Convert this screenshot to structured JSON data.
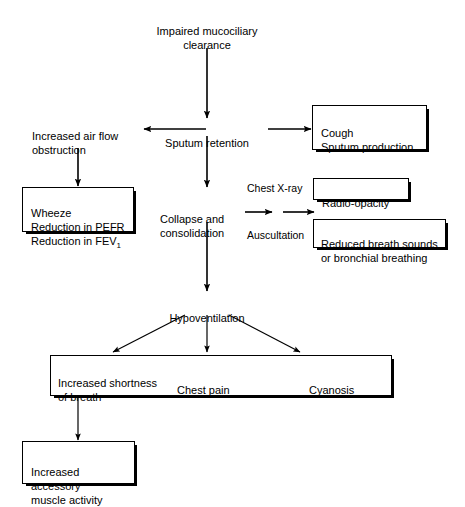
{
  "diagram": {
    "background": "#ffffff",
    "line_color": "#000000",
    "nodes": {
      "impaired": {
        "text": "Impaired mucociliary\nclearance",
        "boxed": false
      },
      "sputum_retention": {
        "text": "Sputum retention",
        "boxed": false
      },
      "airflow_obstruction": {
        "text": "Increased air flow\nobstruction",
        "boxed": false
      },
      "cough": {
        "text": "Cough\nSputum production",
        "boxed": true
      },
      "wheeze": {
        "text": "Wheeze\nReduction in PEFR\nReduction in FEV",
        "subscript": "1",
        "boxed": true
      },
      "collapse": {
        "text": "Collapse and\nconsolidation",
        "boxed": false
      },
      "chest_xray": {
        "text": "Chest X-ray",
        "boxed": false
      },
      "radio_opacity": {
        "text": "Radio-opacity",
        "boxed": true
      },
      "auscultation": {
        "text": "Auscultation",
        "boxed": false
      },
      "reduced_breath": {
        "text": "Reduced breath sounds\nor bronchial breathing",
        "boxed": true
      },
      "hypoventilation": {
        "text": "Hypoventilation",
        "boxed": false
      },
      "shortness": {
        "text": "Increased shortness\nof breath",
        "boxed": false
      },
      "chest_pain": {
        "text": "Chest pain",
        "boxed": false
      },
      "cyanosis": {
        "text": "Cyanosis",
        "boxed": false
      },
      "accessory": {
        "text": "Increased accessory\nmuscle activity",
        "boxed": true
      }
    },
    "edges": [
      {
        "from": "impaired",
        "to": "sputum_retention",
        "style": "arrow-down"
      },
      {
        "from": "sputum_retention",
        "to": "airflow_obstruction",
        "style": "arrow-left"
      },
      {
        "from": "sputum_retention",
        "to": "cough",
        "style": "arrow-right"
      },
      {
        "from": "airflow_obstruction",
        "to": "wheeze",
        "style": "arrow-down"
      },
      {
        "from": "sputum_retention",
        "to": "collapse",
        "style": "arrow-down"
      },
      {
        "from": "collapse",
        "to": "radio_opacity",
        "style": "arrow-right"
      },
      {
        "from": "collapse",
        "to": "reduced_breath",
        "style": "arrow-right"
      },
      {
        "from": "collapse",
        "to": "hypoventilation",
        "style": "arrow-down"
      },
      {
        "from": "hypoventilation",
        "to": "shortness",
        "style": "arrow-diagonal-left"
      },
      {
        "from": "hypoventilation",
        "to": "chest_pain",
        "style": "arrow-down"
      },
      {
        "from": "hypoventilation",
        "to": "cyanosis",
        "style": "arrow-diagonal-right"
      },
      {
        "from": "shortness",
        "to": "accessory",
        "style": "arrow-down"
      }
    ]
  }
}
